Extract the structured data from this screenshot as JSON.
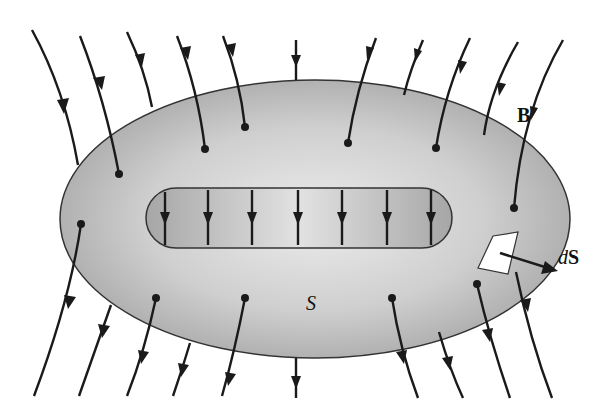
{
  "diagram": {
    "labels": {
      "field": "B",
      "surface": "S",
      "area_element_d": "d",
      "area_element_s": "S"
    },
    "colors": {
      "surface_fill_light": "#e6e6e6",
      "surface_fill_dark": "#a9a9a9",
      "hole_fill": "#c8c8c8",
      "line": "#1a1a1a",
      "background": "#ffffff"
    },
    "field_line_count_outer": 22,
    "field_line_count_hole": 7
  }
}
